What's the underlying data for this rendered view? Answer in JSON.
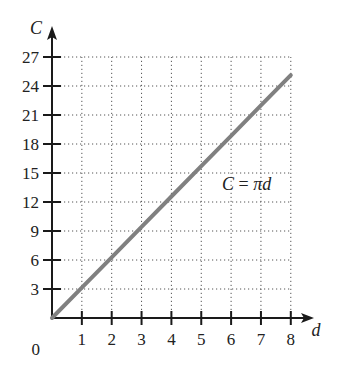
{
  "chart_data": {
    "type": "line",
    "title": "",
    "xlabel": "d",
    "ylabel": "C",
    "x_ticks": [
      1,
      2,
      3,
      4,
      5,
      6,
      7,
      8
    ],
    "y_ticks": [
      3,
      6,
      9,
      12,
      15,
      18,
      21,
      24,
      27
    ],
    "origin_label": "0",
    "xlim": [
      0,
      8
    ],
    "ylim": [
      0,
      27
    ],
    "grid": true,
    "grid_style": "dotted",
    "series": [
      {
        "name": "C = πd",
        "x": [
          0,
          1,
          2,
          3,
          4,
          5,
          6,
          7,
          8
        ],
        "values": [
          0,
          3.14,
          6.28,
          9.42,
          12.57,
          15.71,
          18.85,
          21.99,
          25.13
        ],
        "color": "#808080"
      }
    ],
    "annotations": [
      {
        "text": "C = πd",
        "x": 6.2,
        "y": 15.5
      }
    ]
  },
  "labels": {
    "x_axis": "d",
    "y_axis": "C",
    "origin": "0",
    "equation_left": "C",
    "equation_eq": " = ",
    "equation_right": "πd"
  },
  "colors": {
    "axis": "#1a1a1a",
    "grid": "#555555",
    "line": "#808080"
  }
}
